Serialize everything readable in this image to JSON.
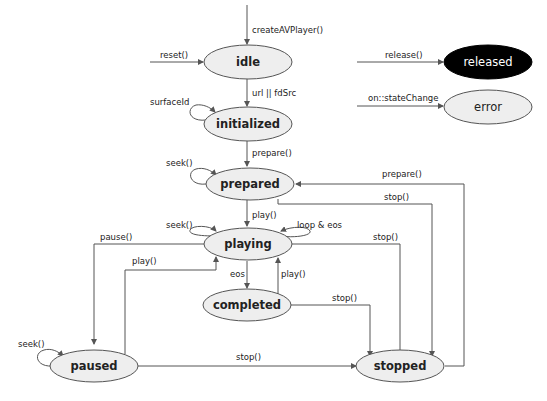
{
  "colors": {
    "state_fill": "#eeeeee",
    "state_stroke": "#555555",
    "released_fill": "#000000",
    "released_text": "#ffffff",
    "edge": "#555555",
    "text": "#222222"
  },
  "states": {
    "idle": "idle",
    "initialized": "initialized",
    "prepared": "prepared",
    "playing": "playing",
    "completed": "completed",
    "paused": "paused",
    "stopped": "stopped",
    "released": "released",
    "error": "error"
  },
  "transitions": {
    "create": "createAVPlayer()",
    "reset": "reset()",
    "url_fdsrc": "url || fdSrc",
    "surfaceid": "surfaceId",
    "prepare_init": "prepare()",
    "seek_prepared": "seek()",
    "play_prepared": "play()",
    "seek_playing": "seek()",
    "loop_eos": "loop & eos",
    "pause": "pause()",
    "play_paused": "play()",
    "eos": "eos",
    "play_completed": "play()",
    "stop_completed": "stop()",
    "stop_playing": "stop()",
    "stop_prepared": "stop()",
    "prepare_stopped": "prepare()",
    "seek_paused": "seek()",
    "stop_paused": "stop()",
    "release": "release()",
    "statechange": "on::stateChange"
  }
}
